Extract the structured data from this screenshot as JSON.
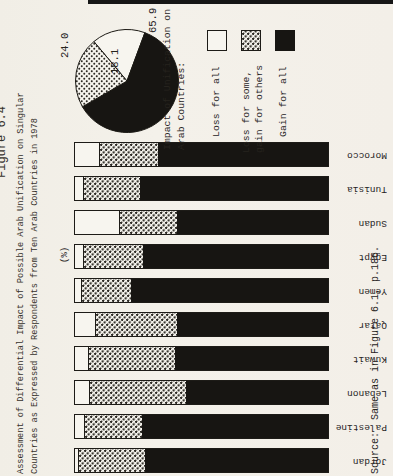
{
  "figure": {
    "label": "Figure 6.4",
    "title_line1": "Assessment of Differential Impact of Possible Arab Unification on Singular",
    "title_line2": "Countries as Expressed by Respondents from Ten Arab Countries in 1978"
  },
  "axis": {
    "unit_label": "(%)"
  },
  "source_note": "Source:  Same as in Figure 6.1, p.186.",
  "legend": {
    "heading_line1": "Impact of Unification on",
    "heading_line2": "Arab Countries:",
    "items": [
      {
        "label": "Loss for all",
        "swatch": "white"
      },
      {
        "label_line1": "Loss for some,",
        "label_line2": "gain for others",
        "swatch": "dotted"
      },
      {
        "label": "Gain for all",
        "swatch": "black"
      }
    ]
  },
  "pie_labels": {
    "dotted": "24.0",
    "white": "18.1",
    "black": "65.9"
  },
  "colors": {
    "ink": "#26231e",
    "paper": "#f3f0e9",
    "bar_black": "#171512"
  },
  "chart_data": [
    {
      "type": "pie",
      "title": "Impact of Unification on Arab Countries:",
      "slices": [
        {
          "label": "Loss for all",
          "value": 18.1,
          "fill": "white"
        },
        {
          "label": "Loss for some, gain for others",
          "value": 24.0,
          "fill": "dotted"
        },
        {
          "label": "Gain for all",
          "value": 65.9,
          "fill": "black"
        }
      ]
    },
    {
      "type": "bar",
      "stacked": true,
      "orientation": "vertical",
      "unit": "(%)",
      "ylim": [
        0,
        100
      ],
      "categories": [
        "Jordan",
        "Palestine",
        "Lebanon",
        "Kuwait",
        "Qatar",
        "Yemen",
        "Egypt",
        "Sudan",
        "Tunisia",
        "Morocco"
      ],
      "series": [
        {
          "name": "Loss for all",
          "values": [
            1,
            3.5,
            5.5,
            5,
            8,
            2.5,
            3,
            17.5,
            3,
            9.5
          ]
        },
        {
          "name": "Loss for some, gain for others",
          "values": [
            26,
            22.5,
            38,
            34,
            32,
            19.5,
            23.5,
            22.5,
            22,
            23
          ]
        },
        {
          "name": "Gain for all",
          "values": [
            73,
            74,
            56.5,
            61,
            60,
            78,
            73.5,
            60,
            75,
            67.5
          ]
        }
      ]
    }
  ]
}
